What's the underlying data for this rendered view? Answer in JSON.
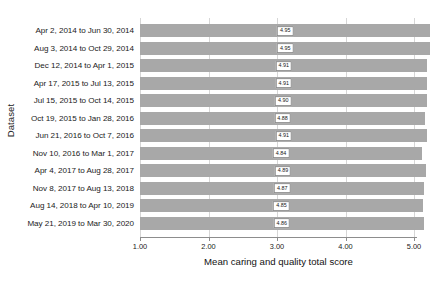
{
  "chart_data": {
    "type": "bar",
    "orientation": "horizontal",
    "title": "",
    "xlabel": "Mean caring and quality total score",
    "ylabel": "Dataset",
    "xlim": [
      1.0,
      5.0
    ],
    "xticks": [
      "1.00",
      "2.00",
      "3.00",
      "4.00",
      "5.00"
    ],
    "xtick_values": [
      1.0,
      2.0,
      3.0,
      4.0,
      5.0
    ],
    "grid": true,
    "legend": false,
    "bar_color": "#a8a8a8",
    "categories": [
      "Apr 2, 2014 to Jun 30, 2014",
      "Aug 3, 2014 to Oct 29, 2014",
      "Dec 12, 2014 to Apr 1, 2015",
      "Apr 17, 2015 to Jul 13, 2015",
      "Jul 15, 2015 to Oct 14, 2015",
      "Oct 19, 2015 to Jan 28, 2016",
      "Jun 21, 2016 to Oct 7, 2016",
      "Nov 10, 2016 to Mar 1, 2017",
      "Apr 4, 2017 to Aug 28, 2017",
      "Nov 8, 2017 to Aug 13, 2018",
      "Aug 14, 2018 to Apr 10, 2019",
      "May 21, 2019 to Mar 30, 2020"
    ],
    "values": [
      4.95,
      4.95,
      4.91,
      4.91,
      4.9,
      4.88,
      4.91,
      4.84,
      4.89,
      4.87,
      4.85,
      4.86
    ],
    "value_labels": [
      "4.95",
      "4.95",
      "4.91",
      "4.91",
      "4.90",
      "4.88",
      "4.91",
      "4.84",
      "4.89",
      "4.87",
      "4.85",
      "4.86"
    ]
  }
}
